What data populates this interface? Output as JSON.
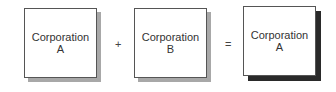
{
  "diagram": {
    "boxes": [
      {
        "line1": "Corporation",
        "line2": "A"
      },
      {
        "line1": "Corporation",
        "line2": "B"
      },
      {
        "line1": "Corporation",
        "line2": "A"
      }
    ],
    "operators": [
      "+",
      "="
    ]
  }
}
